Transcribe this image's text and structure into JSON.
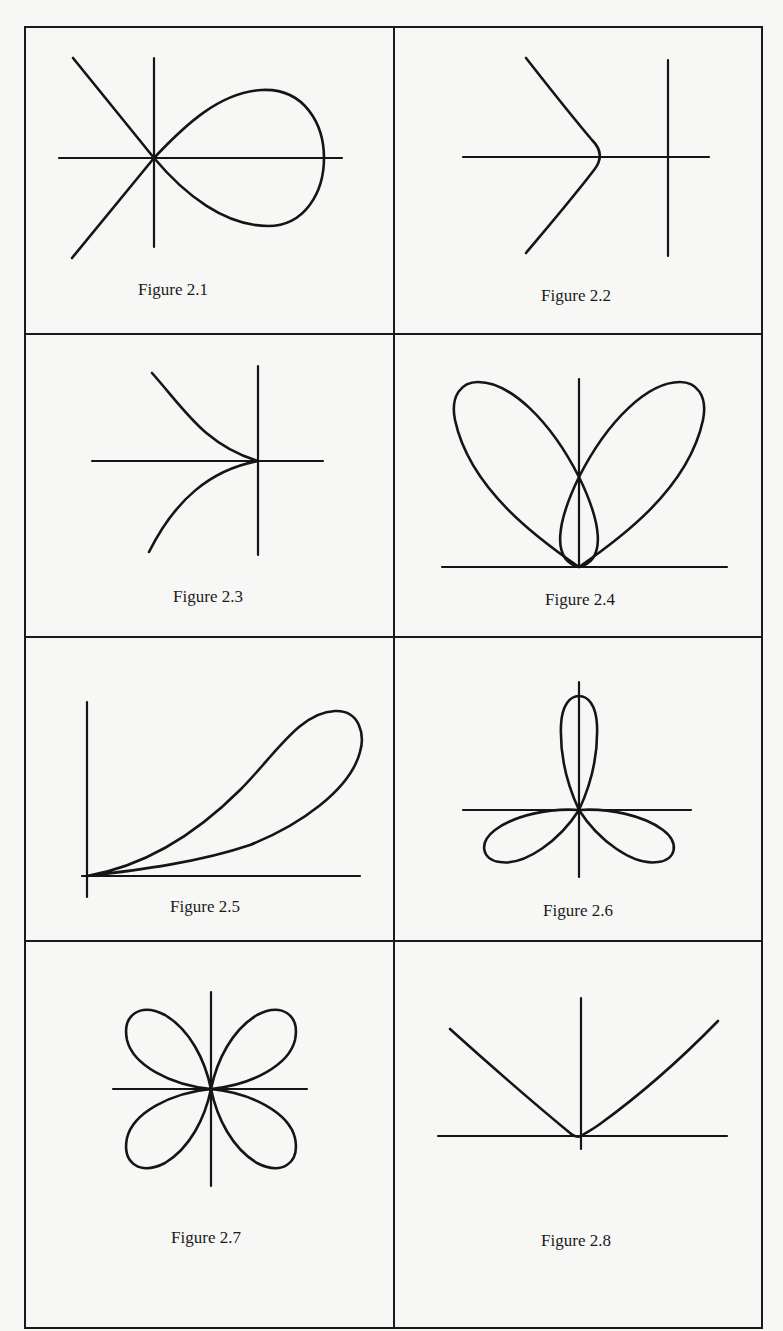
{
  "page": {
    "layout": "2x4 grid of figures in a ruled frame",
    "colors": {
      "background": "#f7f7f5",
      "ink": "#151515"
    }
  },
  "figures": [
    {
      "id": "2.1",
      "caption": "Figure 2.1",
      "depicts": "loop (node) curve with two crossing tangent lines and axes"
    },
    {
      "id": "2.2",
      "caption": "Figure 2.2",
      "depicts": "hyperbola-like branch opening left, vertex on x-axis, with axes"
    },
    {
      "id": "2.3",
      "caption": "Figure 2.3",
      "depicts": "cusp at the origin opening left, with axes"
    },
    {
      "id": "2.4",
      "caption": "Figure 2.4",
      "depicts": "two large petals and one small central loop tangent at origin on x-axis"
    },
    {
      "id": "2.5",
      "caption": "Figure 2.5",
      "depicts": "teardrop loop in first quadrant tangent to x-axis at origin"
    },
    {
      "id": "2.6",
      "caption": "Figure 2.6",
      "depicts": "three-petal rose with one petal along positive y-axis"
    },
    {
      "id": "2.7",
      "caption": "Figure 2.7",
      "depicts": "four-petal rose with petals in each quadrant"
    },
    {
      "id": "2.8",
      "caption": "Figure 2.8",
      "depicts": "V-shaped curve with tangency at origin on x-axis"
    }
  ]
}
